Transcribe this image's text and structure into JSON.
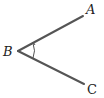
{
  "diagram": {
    "labels": {
      "A": "A",
      "B": "B",
      "C": "C"
    },
    "vertex": {
      "x": 18,
      "y": 51
    },
    "ray_A_end": {
      "x": 83,
      "y": 16
    },
    "ray_C_end": {
      "x": 84,
      "y": 84
    },
    "line_color": "#555555",
    "angle_marker": "arc-with-arrow"
  }
}
